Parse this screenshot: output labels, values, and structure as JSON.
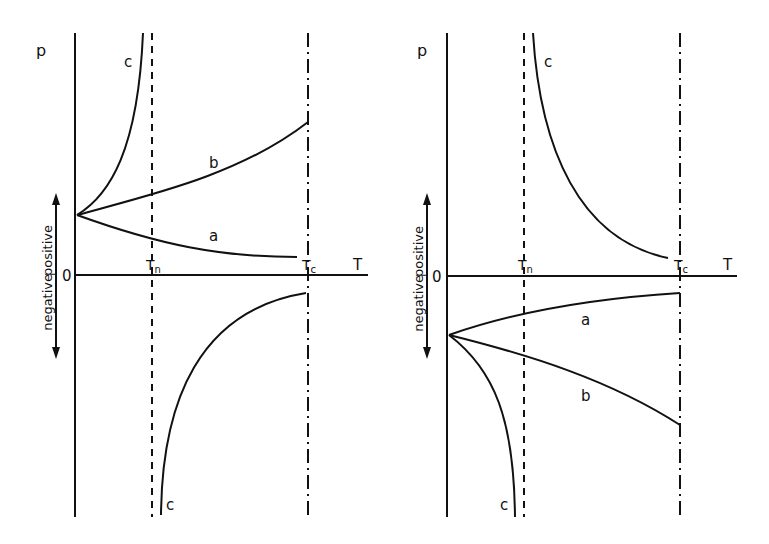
{
  "figure": {
    "panels": [
      {
        "id": "left",
        "y_axis_label": "p",
        "x_axis_label": "T",
        "origin_label": "0",
        "direction_labels": {
          "positive": "positive",
          "negative": "negative"
        },
        "markers": {
          "tn": "T",
          "tn_sub": "n",
          "tc": "T",
          "tc_sub": "c"
        },
        "curve_labels": {
          "c_upper": "c",
          "b": "b",
          "a": "a",
          "c_lower": "c"
        }
      },
      {
        "id": "right",
        "y_axis_label": "p",
        "x_axis_label": "T",
        "origin_label": "0",
        "direction_labels": {
          "positive": "positive",
          "negative": "negative"
        },
        "markers": {
          "tn": "T",
          "tn_sub": "n",
          "tc": "T",
          "tc_sub": "c"
        },
        "curve_labels": {
          "c_upper": "c",
          "a": "a",
          "b": "b",
          "c_lower": "c"
        }
      }
    ]
  }
}
